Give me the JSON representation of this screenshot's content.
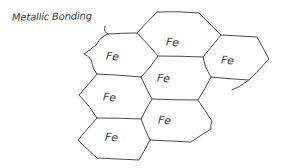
{
  "diagram": {
    "title": "Metallic Bonding",
    "cells": [
      {
        "id": "top",
        "label": "Fe"
      },
      {
        "id": "upper-left",
        "label": "Fe"
      },
      {
        "id": "right",
        "label": "Fe"
      },
      {
        "id": "center",
        "label": "Fe"
      },
      {
        "id": "left-middle",
        "label": "Fe"
      },
      {
        "id": "lower-right",
        "label": "Fe"
      },
      {
        "id": "bottom-left",
        "label": "Fe"
      }
    ],
    "stroke_color": "#4a4a4a",
    "background": "#ffffff"
  }
}
